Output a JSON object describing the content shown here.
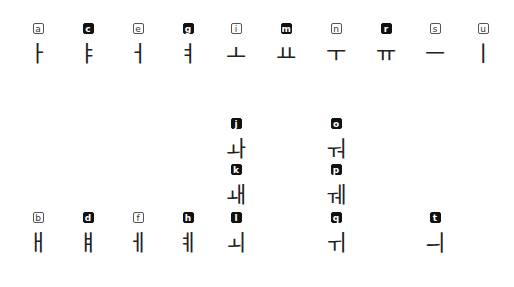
{
  "colors": {
    "background": "#ffffff",
    "label_filled": "#111111",
    "label_outline": "#555555",
    "glyph": "#222222"
  },
  "rows": [
    {
      "y": 17,
      "items": [
        {
          "x": 38,
          "label": "a",
          "style": "outline",
          "glyph": "ㅏ"
        },
        {
          "x": 88,
          "label": "c",
          "style": "filled",
          "glyph": "ㅑ"
        },
        {
          "x": 138,
          "label": "e",
          "style": "outline",
          "glyph": "ㅓ"
        },
        {
          "x": 188,
          "label": "g",
          "style": "filled",
          "glyph": "ㅕ"
        },
        {
          "x": 236,
          "label": "i",
          "style": "outline",
          "glyph": "ㅗ"
        },
        {
          "x": 286,
          "label": "m",
          "style": "filled",
          "glyph": "ㅛ"
        },
        {
          "x": 336,
          "label": "n",
          "style": "outline",
          "glyph": "ㅜ"
        },
        {
          "x": 386,
          "label": "r",
          "style": "filled",
          "glyph": "ㅠ"
        },
        {
          "x": 435,
          "label": "s",
          "style": "outline",
          "glyph": "ㅡ"
        },
        {
          "x": 483,
          "label": "u",
          "style": "outline",
          "glyph": "ㅣ"
        }
      ]
    },
    {
      "y": 112,
      "items": [
        {
          "x": 236,
          "label": "j",
          "style": "filled",
          "glyph": "ㅘ"
        },
        {
          "x": 336,
          "label": "o",
          "style": "filled",
          "glyph": "ㅝ"
        }
      ]
    },
    {
      "y": 158,
      "items": [
        {
          "x": 236,
          "label": "k",
          "style": "filled",
          "glyph": "ㅙ"
        },
        {
          "x": 336,
          "label": "p",
          "style": "filled",
          "glyph": "ㅞ"
        }
      ]
    },
    {
      "y": 206,
      "items": [
        {
          "x": 38,
          "label": "b",
          "style": "outline",
          "glyph": "ㅐ"
        },
        {
          "x": 88,
          "label": "d",
          "style": "filled",
          "glyph": "ㅒ"
        },
        {
          "x": 138,
          "label": "f",
          "style": "outline",
          "glyph": "ㅔ"
        },
        {
          "x": 188,
          "label": "h",
          "style": "filled",
          "glyph": "ㅖ"
        },
        {
          "x": 236,
          "label": "l",
          "style": "filled",
          "glyph": "ㅚ"
        },
        {
          "x": 336,
          "label": "q",
          "style": "filled",
          "glyph": "ㅟ"
        },
        {
          "x": 435,
          "label": "t",
          "style": "filled",
          "glyph": "ㅢ"
        }
      ]
    }
  ]
}
